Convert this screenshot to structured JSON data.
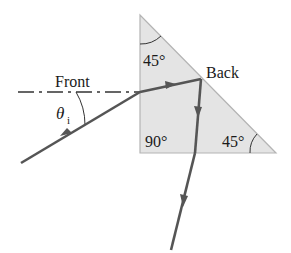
{
  "diagram": {
    "type": "optics-prism-ray",
    "labels": {
      "front": "Front",
      "back": "Back",
      "theta": "θ",
      "theta_subscript": "i",
      "top_angle": "45°",
      "right_angle": "90°",
      "bottom_right_angle": "45°"
    },
    "colors": {
      "prism_fill": "#e4e4e4",
      "prism_edge": "#b4b4b4",
      "ray": "#555555",
      "normal_line": "#333333",
      "text": "#1a1a1a"
    },
    "prism": {
      "top": [
        140,
        15
      ],
      "bottom_left": [
        140,
        153
      ],
      "bottom_right": [
        276,
        153
      ]
    },
    "ray_path": [
      [
        21,
        163
      ],
      [
        140,
        92
      ],
      [
        201,
        79
      ],
      [
        195,
        153
      ],
      [
        171,
        250
      ]
    ]
  }
}
